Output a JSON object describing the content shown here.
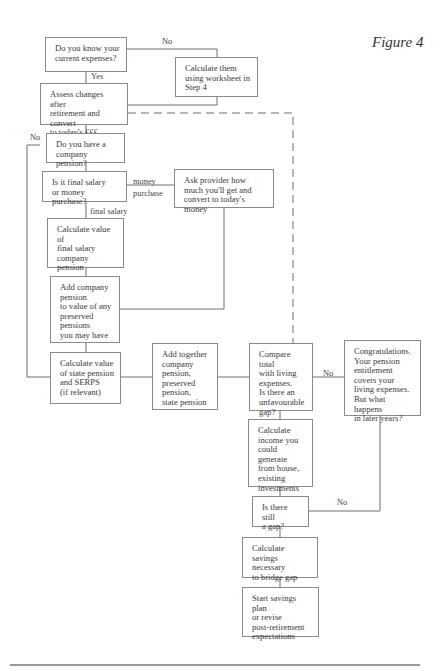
{
  "figure_title": "Figure 4",
  "nodes": {
    "know_expenses": "Do you know your\ncurrent expenses?",
    "calculate_them": "Calculate them\nusing worksheet in\nStep 4",
    "assess_changes": "Assess changes after\nretirement and convert\nto today's £££",
    "company_pension_q": "Do you have a\ncompany pension?",
    "final_or_money": "Is it final salary\nor money purchase?",
    "ask_provider": "Ask provider how\nmuch you'll get and\nconvert to today's money",
    "calc_final_salary": "Calculate value of\nfinal salary\ncompany\npension",
    "add_company": "Add company\npension\nto value of any\npreserved\npensions\nyou may have",
    "calc_state": "Calculate value\nof state pension\nand SERPS\n(if relevant)",
    "add_together": "Add together\ncompany\npension,\npreserved\npension,\nstate pension",
    "compare_total": "Compare total\nwith living\nexpenses.\nIs there an\nunfavourable\ngap?",
    "congratulations": "Congratulations.\nYour pension\nentitlement\ncovers your\nliving expenses.\nBut what happens\nin later years?",
    "calc_income": "Calculate\nincome you\ncould generate\nfrom house,\nexisting\ninvestments",
    "still_gap": "Is there still\na gap?",
    "calc_savings": "Calculate\nsavings necessary\nto bridge gap",
    "start_savings": "Start savings plan\nor revise\npost-retirement\nexpectations"
  },
  "edge_labels": {
    "no_top": "No",
    "yes": "Yes",
    "no_left": "No",
    "money_purchase": "money\npurchase",
    "final_salary": "final salary",
    "no_compare": "No",
    "no_gap": "No"
  }
}
